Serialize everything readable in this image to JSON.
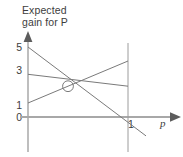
{
  "figure": {
    "title": "Expected\ngain for P",
    "title_line1": "Expected",
    "title_line2": "gain for P",
    "background_color": "#ffffff",
    "line_color": "#6e6e6e",
    "axis_color": "#9a9a9a",
    "text_color": "#3d3d3d",
    "marker_label": "intersection"
  },
  "axes": {
    "y_axis_label": "Expected gain for P",
    "x_axis_label": "p",
    "y_ticks": [
      "5",
      "3",
      "1",
      "0"
    ],
    "y_tick_values": [
      5,
      3,
      1,
      0
    ],
    "x_ticks": [
      "1"
    ],
    "x_tick_values": [
      1
    ],
    "y_arrow": "up-arrow",
    "x_arrow": "right-arrow"
  },
  "chart_data": {
    "type": "line",
    "title": "Expected gain for P",
    "xlabel": "p",
    "ylabel": "Expected gain for P",
    "xlim": [
      0,
      1.45
    ],
    "ylim": [
      -1.6,
      6.2
    ],
    "xticks": [
      1
    ],
    "xticklabels": [
      "1"
    ],
    "yticks": [
      0,
      1,
      3,
      5
    ],
    "yticklabels": [
      "0",
      "1",
      "3",
      "5"
    ],
    "grid": false,
    "legend": false,
    "series": [
      {
        "name": "line-1-steep-decreasing",
        "x": [
          0,
          1.18
        ],
        "y": [
          5.0,
          -1.35
        ],
        "description": "steeply decreasing line from 5 at p=0, crossing zero near p=0.79, continuing below axis past p=1"
      },
      {
        "name": "line-2-gently-decreasing",
        "x": [
          0,
          1.0
        ],
        "y": [
          3.05,
          2.2
        ],
        "description": "gently decreasing line from about 3 at p=0 to about 2.2 at p=1"
      },
      {
        "name": "line-3-increasing",
        "x": [
          0,
          1.0
        ],
        "y": [
          1.0,
          4.0
        ],
        "description": "increasing line from 1 at p=0 to about 4 at p=1"
      }
    ],
    "annotations": [
      {
        "type": "circle-marker",
        "x": 0.4,
        "y": 2.2,
        "label": "equilibrium intersection point"
      },
      {
        "type": "vertical-line",
        "x": 1.0,
        "label": "p = 1 boundary"
      }
    ]
  }
}
